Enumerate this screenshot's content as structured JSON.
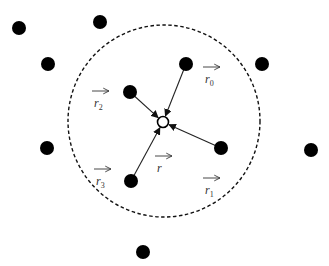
{
  "diagram": {
    "type": "neighborhood-vector-sum",
    "center_point": {
      "x": 163,
      "y": 122,
      "style": "open-circle"
    },
    "neighborhood_circle": {
      "cx": 164,
      "cy": 121,
      "r": 96,
      "style": "dashed"
    },
    "outer_points": [
      {
        "x": 19,
        "y": 28
      },
      {
        "x": 100,
        "y": 22
      },
      {
        "x": 48,
        "y": 64
      },
      {
        "x": 262,
        "y": 64
      },
      {
        "x": 47,
        "y": 148
      },
      {
        "x": 311,
        "y": 150
      },
      {
        "x": 143,
        "y": 252
      }
    ],
    "neighbor_points": [
      {
        "id": "p0",
        "x": 186,
        "y": 64
      },
      {
        "id": "p1",
        "x": 221,
        "y": 148
      },
      {
        "id": "p2",
        "x": 130,
        "y": 92
      },
      {
        "id": "p3",
        "x": 131,
        "y": 181
      }
    ],
    "labels": [
      {
        "base": "r",
        "sub": "0",
        "x": 205,
        "y": 80,
        "arrow": true
      },
      {
        "base": "r",
        "sub": "1",
        "x": 205,
        "y": 191,
        "arrow": true
      },
      {
        "base": "r",
        "sub": "2",
        "x": 94,
        "y": 104,
        "arrow": true
      },
      {
        "base": "r",
        "sub": "3",
        "x": 96,
        "y": 182,
        "arrow": true
      },
      {
        "base": "r",
        "sub": "",
        "x": 157,
        "y": 169,
        "arrow": true
      }
    ]
  }
}
